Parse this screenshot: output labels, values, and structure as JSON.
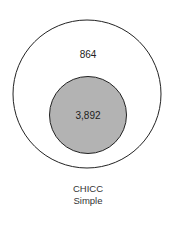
{
  "diagram": {
    "type": "nested-venn",
    "outer": {
      "label": "864",
      "fill": "#ffffff",
      "stroke": "#222222"
    },
    "inner": {
      "label": "3,892",
      "fill": "#b3b3b3",
      "stroke": "#222222"
    },
    "caption": {
      "line1": "CHICC",
      "line2": "Simple"
    }
  }
}
